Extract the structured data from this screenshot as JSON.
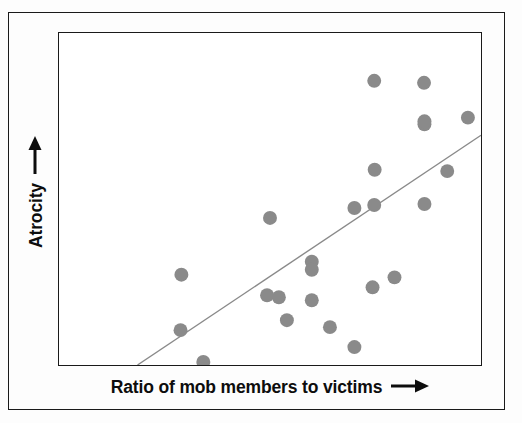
{
  "figure": {
    "background_color": "#fdfdfd",
    "frame_color": "#1a1a1a"
  },
  "axes": {
    "x_label": "Ratio of mob members to victims",
    "x_arrow_icon": "right-arrow-icon",
    "y_label": "Atrocity",
    "y_arrow_icon": "up-arrow-icon"
  },
  "chart_data": {
    "type": "scatter",
    "title": "",
    "xlabel": "Ratio of mob members to victims",
    "ylabel": "Atrocity",
    "xlim": [
      0,
      100
    ],
    "ylim": [
      0,
      100
    ],
    "grid": false,
    "legend": "none",
    "axis_ticks": "none",
    "point_color": "#8a8a8a",
    "point_radius_px": 7,
    "trendline": {
      "name": "fit-line",
      "color": "#8a8a8a",
      "width_px": 1.4,
      "x1": 18.6,
      "y1": 0,
      "x2": 100,
      "y2": 69.2
    },
    "points": [
      {
        "x": 29.0,
        "y": 27.2
      },
      {
        "x": 28.8,
        "y": 10.5
      },
      {
        "x": 34.2,
        "y": 0.9
      },
      {
        "x": 49.3,
        "y": 21.0
      },
      {
        "x": 52.1,
        "y": 20.4
      },
      {
        "x": 54.0,
        "y": 13.5
      },
      {
        "x": 50.0,
        "y": 44.3
      },
      {
        "x": 59.9,
        "y": 31.1
      },
      {
        "x": 59.9,
        "y": 28.7
      },
      {
        "x": 59.9,
        "y": 19.5
      },
      {
        "x": 64.2,
        "y": 11.4
      },
      {
        "x": 70.0,
        "y": 5.4
      },
      {
        "x": 74.3,
        "y": 23.4
      },
      {
        "x": 79.5,
        "y": 26.4
      },
      {
        "x": 74.7,
        "y": 48.2
      },
      {
        "x": 70.0,
        "y": 47.3
      },
      {
        "x": 86.6,
        "y": 48.5
      },
      {
        "x": 74.8,
        "y": 58.8
      },
      {
        "x": 92.0,
        "y": 58.4
      },
      {
        "x": 86.6,
        "y": 72.5
      },
      {
        "x": 86.5,
        "y": 85.0
      },
      {
        "x": 96.9,
        "y": 74.5
      },
      {
        "x": 86.6,
        "y": 73.4
      },
      {
        "x": 74.7,
        "y": 85.6
      }
    ]
  }
}
